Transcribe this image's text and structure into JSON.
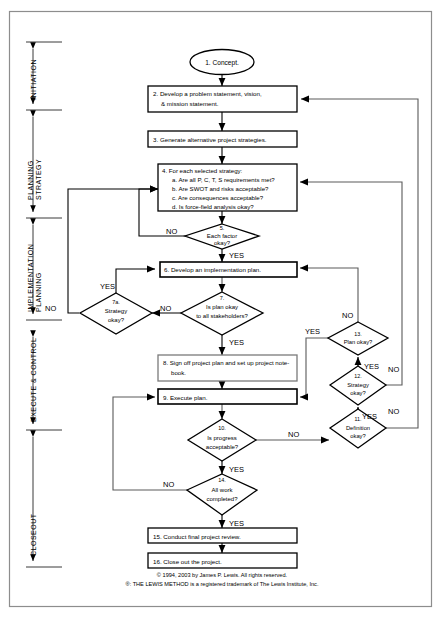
{
  "diagram": {
    "border_color": "#8a8a8a",
    "line_color": "#555555",
    "shape_stroke": "#000000",
    "text_color": "#000000",
    "phases": [
      {
        "id": "initiation",
        "label": "INITIATION"
      },
      {
        "id": "planning-strategy",
        "label": "PLANNING\nSTRATEGY",
        "line1": "PLANNING",
        "line2": "STRATEGY"
      },
      {
        "id": "implementation-planning",
        "label": "IMPLEMENTATION\nPLANNING",
        "line1": "IMPLEMENTATION",
        "line2": "PLANNING"
      },
      {
        "id": "execute-control",
        "label": "EXECUTE & CONTROL"
      },
      {
        "id": "closeout",
        "label": "CLOSEOUT"
      }
    ],
    "nodes": [
      {
        "id": "n1",
        "type": "terminator",
        "number": "1.",
        "text": "1. Concept."
      },
      {
        "id": "n2",
        "type": "process",
        "number": "2.",
        "line1": "2. Develop a problem statement, vision,",
        "line2": "& mission  statement."
      },
      {
        "id": "n3",
        "type": "process",
        "number": "3.",
        "line1": "3. Generate alternative project strategies."
      },
      {
        "id": "n4",
        "type": "process",
        "number": "4.",
        "line1": "4. For each selected strategy:",
        "line2": "a. Are all P, C, T, S requirements met?",
        "line3": "b. Are SWOT and risks acceptable?",
        "line4": "c. Are consequences acceptable?",
        "line5": "d. Is force-field analysis okay?"
      },
      {
        "id": "n5",
        "type": "decision",
        "number": "5.",
        "line1": "5.",
        "line2": "Each factor",
        "line3": "okay?"
      },
      {
        "id": "n6",
        "type": "process",
        "number": "6.",
        "line1": "6. Develop an implementation plan."
      },
      {
        "id": "n7",
        "type": "decision",
        "number": "7.",
        "line1": "7.",
        "line2": "Is  plan okay",
        "line3": "to all stakeholders?"
      },
      {
        "id": "n7a",
        "type": "decision",
        "number": "7a.",
        "line1": "7a.",
        "line2": "Strategy",
        "line3": "okay?"
      },
      {
        "id": "n8",
        "type": "process",
        "number": "8.",
        "line1": "8. Sign off project plan and set up project note-",
        "line2": "book."
      },
      {
        "id": "n9",
        "type": "process",
        "number": "9.",
        "line1": "9. Execute plan."
      },
      {
        "id": "n10",
        "type": "decision",
        "number": "10.",
        "line1": "10.",
        "line2": "Is  progress",
        "line3": "acceptable?"
      },
      {
        "id": "n11",
        "type": "decision",
        "number": "11.",
        "line1": "11.",
        "line2": "Definition",
        "line3": "okay?"
      },
      {
        "id": "n12",
        "type": "decision",
        "number": "12.",
        "line1": "12.",
        "line2": "Strategy",
        "line3": "okay?"
      },
      {
        "id": "n13",
        "type": "decision",
        "number": "13.",
        "line1": "13.",
        "line2": "Plan okay?"
      },
      {
        "id": "n14",
        "type": "decision",
        "number": "14.",
        "line1": "14.",
        "line2": "All work",
        "line3": "completed?"
      },
      {
        "id": "n15",
        "type": "process",
        "number": "15.",
        "line1": "15. Conduct final project review."
      },
      {
        "id": "n16",
        "type": "process",
        "number": "16.",
        "line1": "16. Close out the project."
      }
    ],
    "edge_labels": {
      "n5_no": "NO",
      "n5_yes": "YES",
      "n7_no": "NO",
      "n7_yes": "YES",
      "n7a_no": "NO",
      "n7a_yes": "YES",
      "n10_no": "NO",
      "n10_yes": "YES",
      "n11_no": "NO",
      "n11_yes": "YES",
      "n12_no": "NO",
      "n12_yes": "YES",
      "n13_no": "NO",
      "n13_yes": "YES",
      "n14_no": "NO",
      "n14_yes": "YES"
    },
    "footer": {
      "line1": "© 1994, 2003 by James P. Lewis. All rights reserved.",
      "line2": "®: THE LEWIS METHOD is a registered trademark of The Lewis Institute, Inc."
    }
  }
}
